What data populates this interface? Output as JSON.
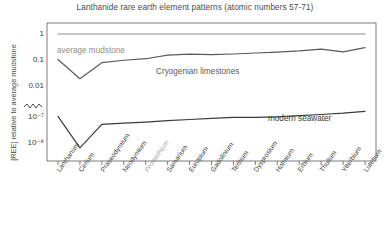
{
  "chart_data": {
    "type": "line",
    "title": "Lanthanide rare earth element patterns (atomic numbers 57-71)",
    "xlabel": "",
    "ylabel": "[REE] relative to average mudstone",
    "grid": false,
    "legend_position": "inline-annotations",
    "yscale": "log",
    "y_axis_broken": true,
    "y_tick_labels": [
      "1",
      "0.1",
      "0.01",
      "10⁻⁷",
      "10⁻⁸"
    ],
    "y_tick_values": [
      1,
      0.1,
      0.01,
      1e-07,
      1e-08
    ],
    "ylim_upper_segment": [
      0.01,
      1
    ],
    "ylim_lower_segment": [
      1e-08,
      1e-07
    ],
    "categories": [
      "Lanthanum",
      "Cerium",
      "Praseodymium",
      "Neodymium",
      "Promethium",
      "Samarium",
      "Europium",
      "Gadolinium",
      "Terbium",
      "Dysprosium",
      "Holmium",
      "Erbium",
      "Thulium",
      "Ytterbium",
      "Lutetium"
    ],
    "category_symbols": [
      "La",
      "Ce",
      "Pr",
      "Nd",
      "Pm",
      "Sm",
      "Eu",
      "Gd",
      "Tb",
      "Dy",
      "Ho",
      "Er",
      "Tm",
      "Yb",
      "Lu"
    ],
    "atomic_numbers": [
      57,
      58,
      59,
      60,
      61,
      62,
      63,
      64,
      65,
      66,
      67,
      68,
      69,
      70,
      71
    ],
    "inactive_categories": [
      "Promethium"
    ],
    "series": [
      {
        "name": "average mudstone",
        "color": "#8d8d8d",
        "values": [
          1,
          1,
          1,
          1,
          1,
          1,
          1,
          1,
          1,
          1,
          1,
          1,
          1,
          1,
          1
        ]
      },
      {
        "name": "Cryogenian limestones",
        "color": "#5a5a5a",
        "values": [
          0.105,
          0.019,
          0.079,
          0.098,
          0.112,
          0.155,
          0.168,
          0.16,
          0.17,
          0.186,
          0.202,
          0.225,
          0.262,
          0.205,
          0.3
        ]
      },
      {
        "name": "modern seawater",
        "color": "#3b3b3b",
        "values": [
          1.05e-07,
          6.5e-09,
          5.2e-08,
          5.8e-08,
          6.4e-08,
          7.2e-08,
          8e-08,
          8.9e-08,
          9.6e-08,
          9.7e-08,
          1.02e-07,
          1.12e-07,
          1.25e-07,
          1.4e-07,
          1.65e-07
        ]
      }
    ],
    "annotations": [
      {
        "text": "average mudstone",
        "series": "average mudstone"
      },
      {
        "text": "Cryogenian limestones",
        "series": "Cryogenian limestones"
      },
      {
        "text": "modern seawater",
        "series": "modern seawater"
      }
    ]
  },
  "colors": {
    "background": "#ffffff",
    "frame": "#6e6e6e",
    "text": "#3b3b3b",
    "muted_text": "#a8a8a8",
    "mudstone": "#8d8d8d",
    "cryogenian": "#5a5a5a",
    "seawater": "#3b3b3b"
  }
}
